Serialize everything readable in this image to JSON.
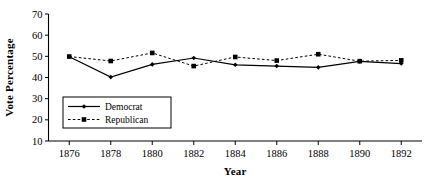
{
  "chart_data": {
    "type": "line",
    "title": "",
    "xlabel": "Year",
    "ylabel": "Vote Percentage",
    "x": [
      1876,
      1878,
      1880,
      1882,
      1884,
      1886,
      1888,
      1890,
      1892
    ],
    "xtick_labels": [
      "1876",
      "1878",
      "1880",
      "1882",
      "1884",
      "1886",
      "1888",
      "1890",
      "1892"
    ],
    "ytick_labels": [
      "10",
      "20",
      "30",
      "40",
      "50",
      "60",
      "70"
    ],
    "yticks": [
      10,
      20,
      30,
      40,
      50,
      60,
      70
    ],
    "xlim": [
      1875,
      1893
    ],
    "ylim": [
      10,
      70
    ],
    "grid": false,
    "legend_position": "lower-left-inside",
    "series": [
      {
        "name": "Democrat",
        "values": [
          49.8,
          40.2,
          46.2,
          49.2,
          46.0,
          45.4,
          44.8,
          47.6,
          46.6
        ],
        "line_style": "solid",
        "marker": "diamond",
        "color": "#000000"
      },
      {
        "name": "Republican",
        "values": [
          49.9,
          47.8,
          51.6,
          45.4,
          49.7,
          48.0,
          51.0,
          47.7,
          48.1
        ],
        "line_style": "dashed",
        "marker": "square",
        "color": "#000000"
      }
    ]
  }
}
